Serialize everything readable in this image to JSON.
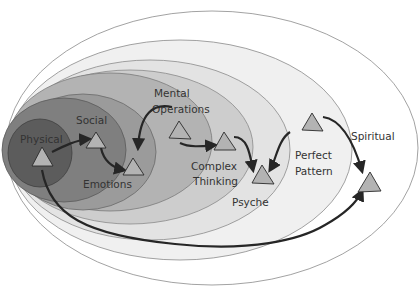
{
  "diagram": {
    "type": "nested-ellipses-with-path",
    "levels": [
      {
        "id": "physical",
        "label": "Physical",
        "fill": "#5e5e5e"
      },
      {
        "id": "social",
        "label": "Social",
        "fill": "#7a7a7a"
      },
      {
        "id": "emotions",
        "label": "Emotions",
        "fill": "#9a9a9a"
      },
      {
        "id": "mental_operations",
        "label_line1": "Mental",
        "label_line2": "Operations",
        "fill": "#b4b4b4"
      },
      {
        "id": "complex_thinking",
        "label_line1": "Complex",
        "label_line2": "Thinking",
        "fill": "#cfcfcf"
      },
      {
        "id": "psyche",
        "label": "Psyche",
        "fill": "#e2e2e2"
      },
      {
        "id": "perfect_pattern",
        "label_line1": "Perfect",
        "label_line2": "Pattern",
        "fill": "#ececec"
      },
      {
        "id": "spiritual",
        "label": "Spiritual",
        "fill": "#ffffff"
      }
    ],
    "path_description": "Arrowed path linking triangles: Physical -> Social -> Emotions -> Mental Operations -> Complex Thinking -> Psyche -> Perfect Pattern -> Spiritual, with return arrow from Physical to Spiritual along the bottom",
    "colors": {
      "triangle_fill": "#b3b3b3",
      "arrow": "#262626",
      "outline": "#8a8a8a"
    }
  }
}
